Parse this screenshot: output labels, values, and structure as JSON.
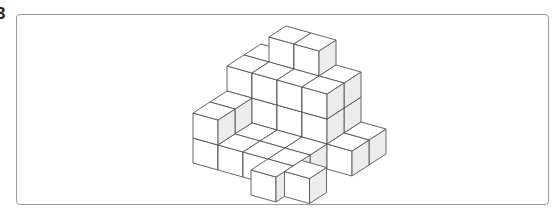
{
  "problem": {
    "number_label": "3"
  },
  "figure": {
    "projection": {
      "origin": [
        193,
        163
      ],
      "u": [
        25,
        7
      ],
      "v": [
        17,
        -11
      ],
      "w": [
        0,
        -25
      ]
    },
    "colors": {
      "top": "#ffffff",
      "front": "#ffffff",
      "side": "#ececec",
      "edge": "#555555",
      "frame": "#9a9a9a"
    },
    "cubes": [
      [
        0,
        0,
        0
      ],
      [
        0,
        0,
        1
      ],
      [
        0,
        1,
        0
      ],
      [
        0,
        1,
        1
      ],
      [
        0,
        2,
        0
      ],
      [
        0,
        2,
        1
      ],
      [
        0,
        2,
        2
      ],
      [
        0,
        3,
        0
      ],
      [
        0,
        3,
        1
      ],
      [
        0,
        3,
        2
      ],
      [
        1,
        2,
        0
      ],
      [
        1,
        2,
        1
      ],
      [
        1,
        2,
        2
      ],
      [
        1,
        3,
        0
      ],
      [
        1,
        3,
        1
      ],
      [
        1,
        3,
        2
      ],
      [
        1,
        3,
        3
      ],
      [
        2,
        2,
        0
      ],
      [
        2,
        2,
        1
      ],
      [
        2,
        2,
        2
      ],
      [
        2,
        3,
        0
      ],
      [
        2,
        3,
        1
      ],
      [
        2,
        3,
        2
      ],
      [
        2,
        3,
        3
      ],
      [
        3,
        2,
        0
      ],
      [
        3,
        2,
        1
      ],
      [
        3,
        2,
        2
      ],
      [
        3,
        3,
        0
      ],
      [
        3,
        3,
        1
      ],
      [
        3,
        3,
        2
      ],
      [
        1,
        0,
        0
      ],
      [
        1,
        1,
        0
      ],
      [
        2,
        0,
        0
      ],
      [
        2,
        1,
        0
      ],
      [
        3,
        0,
        0
      ],
      [
        3,
        1,
        0
      ],
      [
        4,
        3,
        0
      ],
      [
        4,
        2,
        0
      ],
      [
        3,
        -1,
        0
      ],
      [
        4,
        -0.5,
        0
      ]
    ]
  }
}
